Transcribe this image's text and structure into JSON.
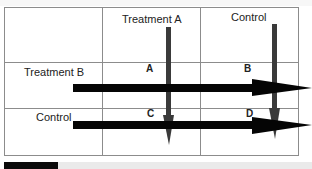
{
  "diagram": {
    "type": "factorial-design-2x2",
    "column_headers": [
      "Treatment A",
      "Control"
    ],
    "row_headers": [
      "Treatment B",
      "Control"
    ],
    "cells": [
      {
        "row": 0,
        "col": 0,
        "label": "A"
      },
      {
        "row": 0,
        "col": 1,
        "label": "B"
      },
      {
        "row": 1,
        "col": 0,
        "label": "C"
      },
      {
        "row": 1,
        "col": 1,
        "label": "D"
      }
    ],
    "arrows": {
      "vertical": [
        "Treatment A column",
        "Control column"
      ],
      "horizontal": [
        "Treatment B row",
        "Control row"
      ]
    },
    "colors": {
      "grid": "#8c8c8c",
      "vertical_arrow": "#3a3a3a",
      "horizontal_arrow": "#050505",
      "text": "#222222"
    }
  }
}
